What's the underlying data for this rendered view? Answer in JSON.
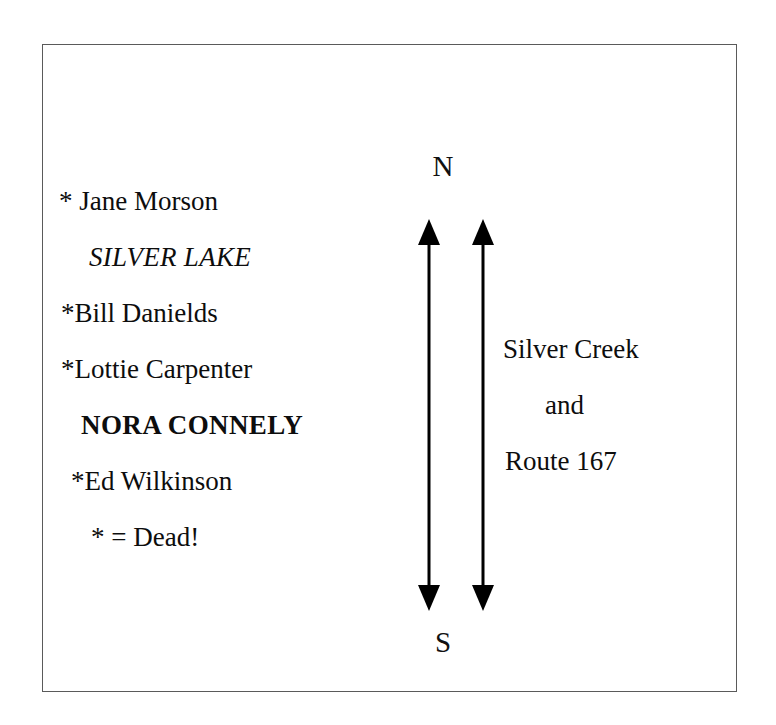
{
  "diagram": {
    "border_color": "#5a5a5a",
    "background_color": "#ffffff",
    "text_color": "#0d0d0d"
  },
  "name_list": {
    "entries": [
      {
        "text": "* Jane Morson",
        "style": "regular"
      },
      {
        "text": "SILVER LAKE",
        "style": "italic"
      },
      {
        "text": "*Bill Danields",
        "style": "regular"
      },
      {
        "text": "*Lottie Carpenter",
        "style": "regular"
      },
      {
        "text": "NORA CONNELY",
        "style": "bold"
      },
      {
        "text": "*Ed Wilkinson",
        "style": "regular"
      },
      {
        "text": "* = Dead!",
        "style": "regular"
      }
    ]
  },
  "compass": {
    "north_label": "N",
    "south_label": "S",
    "arrow_count": 2,
    "arrow_type": "double-headed-vertical"
  },
  "road_labels": {
    "lines": [
      {
        "text": "Silver Creek"
      },
      {
        "text": "and"
      },
      {
        "text": "Route 167"
      }
    ]
  }
}
